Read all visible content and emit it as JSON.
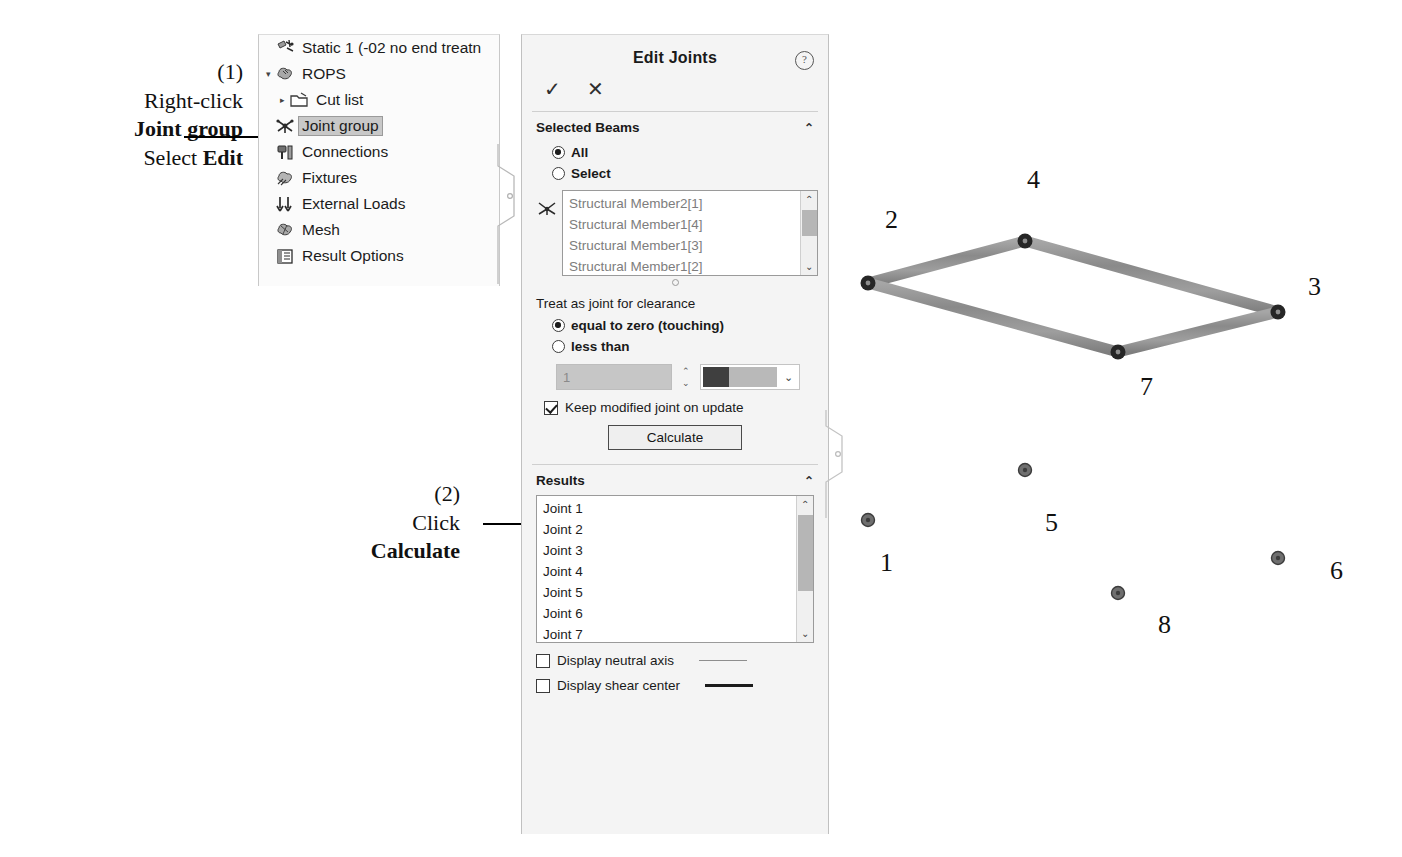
{
  "annotations": [
    {
      "id": "step1",
      "number": "(1)",
      "line1": "Right-click",
      "line2": "Joint group",
      "line3_prefix": "Select ",
      "line3_bold": "Edit"
    },
    {
      "id": "step2",
      "number": "(2)",
      "line1": "Click",
      "line2": "Calculate"
    }
  ],
  "tree": {
    "items": [
      {
        "label": "Static 1 (-02 no end treatn",
        "icon": "study-icon",
        "indent": 1,
        "expander": "",
        "selected": false
      },
      {
        "label": "ROPS",
        "icon": "part-icon",
        "indent": 1,
        "expander": "▾",
        "selected": false
      },
      {
        "label": "Cut list",
        "icon": "folder-icon",
        "indent": 2,
        "expander": "▸",
        "selected": false
      },
      {
        "label": "Joint group",
        "icon": "joint-group-icon",
        "indent": 1,
        "expander": "",
        "selected": true
      },
      {
        "label": "Connections",
        "icon": "connections-icon",
        "indent": 1,
        "expander": "",
        "selected": false
      },
      {
        "label": "Fixtures",
        "icon": "fixtures-icon",
        "indent": 1,
        "expander": "",
        "selected": false
      },
      {
        "label": "External Loads",
        "icon": "external-loads-icon",
        "indent": 1,
        "expander": "",
        "selected": false
      },
      {
        "label": "Mesh",
        "icon": "mesh-icon",
        "indent": 1,
        "expander": "",
        "selected": false
      },
      {
        "label": "Result Options",
        "icon": "result-options-icon",
        "indent": 1,
        "expander": "",
        "selected": false
      }
    ]
  },
  "panel": {
    "title": "Edit Joints",
    "help_glyph": "?",
    "accept_glyph": "✓",
    "cancel_glyph": "✕",
    "selected_beams": {
      "header": "Selected Beams",
      "collapse_glyph": "⌃",
      "radio_all": "All",
      "radio_select": "Select",
      "radio_selected": "All",
      "list_items": [
        "Structural Member2[1]",
        "Structural Member1[4]",
        "Structural Member1[3]",
        "Structural Member1[2]"
      ]
    },
    "clearance": {
      "label": "Treat as joint for clearance",
      "radio_zero": "equal to zero (touching)",
      "radio_less": "less than",
      "radio_selected": "equal to zero (touching)",
      "value": "1",
      "value_enabled": false,
      "swatch_color": "#3f3f3f"
    },
    "keep_modified": {
      "label": "Keep modified joint on update",
      "checked": true
    },
    "calculate_label": "Calculate",
    "results": {
      "header": "Results",
      "collapse_glyph": "⌃",
      "items": [
        "Joint 1",
        "Joint 2",
        "Joint 3",
        "Joint 4",
        "Joint 5",
        "Joint 6",
        "Joint 7"
      ]
    },
    "display_options": [
      {
        "label": "Display neutral axis",
        "checked": false,
        "sample": "thin"
      },
      {
        "label": "Display shear center",
        "checked": false,
        "sample": "thick"
      }
    ]
  },
  "frame": {
    "caption_numbers": [
      "1",
      "2",
      "3",
      "4",
      "5",
      "6",
      "7",
      "8"
    ],
    "beam_color": "#8c8c8c",
    "joint_color": "#262626",
    "labels": [
      {
        "text": "1",
        "x": 50,
        "y": 408
      },
      {
        "text": "2",
        "x": 55,
        "y": 65
      },
      {
        "text": "3",
        "x": 330,
        "y": 132
      },
      {
        "text": "4",
        "x": 195,
        "y": 25
      },
      {
        "text": "5",
        "x": 143,
        "y": 368
      },
      {
        "text": "6",
        "x": 370,
        "y": 416
      },
      {
        "text": "7",
        "x": 205,
        "y": 230
      },
      {
        "text": "8",
        "x": 248,
        "y": 462
      }
    ]
  }
}
